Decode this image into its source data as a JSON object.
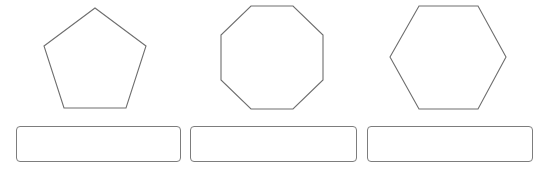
{
  "figure": {
    "shapes": [
      {
        "name": "pentagon",
        "sides": 5,
        "points": "95,8 146,46 126,108 64,108 44,46"
      },
      {
        "name": "octagon",
        "sides": 8,
        "points": "251,6 293,6 323,35 323,80 293,109 251,109 221,80 221,35"
      },
      {
        "name": "hexagon",
        "sides": 6,
        "points": "419,6 478,6 506,57 478,109 419,109 390,57"
      }
    ],
    "stroke_color": "#6e6e6e"
  },
  "answers": [
    {
      "value": "",
      "placeholder": ""
    },
    {
      "value": "",
      "placeholder": ""
    },
    {
      "value": "",
      "placeholder": ""
    }
  ],
  "colors": {
    "background": "#ffffff",
    "box_border": "#7d7d7d"
  }
}
